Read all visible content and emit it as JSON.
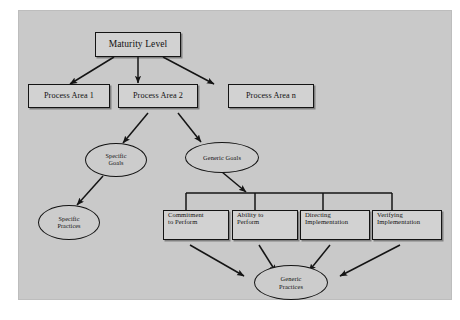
{
  "diagram": {
    "background_color": "#c9c9c9",
    "page_color": "#ffffff",
    "node_fill": "#d2d2d2",
    "stroke_color": "#141414",
    "nodes": {
      "maturity_level": "Maturity Level",
      "process_area_1": "Process Area 1",
      "process_area_2": "Process Area 2",
      "process_area_n": "Process Area n",
      "specific_goals": "Specific\nGoals",
      "specific_goals_line1": "Specific",
      "specific_goals_line2": "Goals",
      "generic_goals": "Generic Goals",
      "specific_practices_line1": "Specific",
      "specific_practices_line2": "Practices",
      "commitment_line1": "Commitment",
      "commitment_line2": "to Perform",
      "ability_line1": "Ability to",
      "ability_line2": "Perform",
      "directing_line1": "Directing",
      "directing_line2": "Implementation",
      "verifying_line1": "Verifying",
      "verifying_line2": "Implementation",
      "generic_practices_line1": "Generic",
      "generic_practices_line2": "Practices"
    }
  }
}
